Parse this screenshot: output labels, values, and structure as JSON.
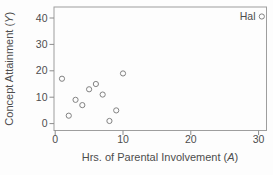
{
  "chart_data": {
    "type": "scatter",
    "title": "",
    "xlabel": "Hrs. of Parental Involvement (A)",
    "ylabel": "Concept Attainment (Y)",
    "xlim": [
      0,
      30
    ],
    "ylim": [
      0,
      40
    ],
    "x_ticks": [
      0,
      10,
      20,
      30
    ],
    "y_ticks": [
      0,
      10,
      20,
      30,
      40
    ],
    "grid": false,
    "legend": {
      "position": "top-right",
      "entries": [
        {
          "label": "Hal",
          "marker": "open-circle"
        }
      ]
    },
    "series": [
      {
        "name": "Hal",
        "marker": "open-circle",
        "points": [
          {
            "x": 1,
            "y": 17
          },
          {
            "x": 2,
            "y": 3
          },
          {
            "x": 3,
            "y": 9
          },
          {
            "x": 4,
            "y": 7
          },
          {
            "x": 5,
            "y": 13
          },
          {
            "x": 6,
            "y": 15
          },
          {
            "x": 7,
            "y": 11
          },
          {
            "x": 8,
            "y": 1
          },
          {
            "x": 9,
            "y": 5
          },
          {
            "x": 10,
            "y": 19
          }
        ]
      }
    ],
    "colors": {
      "background": "#fdfdfd",
      "frame": "#9e9e9e",
      "tick": "#8c8c8c",
      "text": "#4d4d4d",
      "marker_stroke": "#828282"
    }
  },
  "labels": {
    "xlabel_prefix": "Hrs. of Parental Involvement (",
    "xlabel_var": "A",
    "xlabel_suffix": ")",
    "ylabel_prefix": "Concept Attainment (",
    "ylabel_var": "Y",
    "ylabel_suffix": ")",
    "legend_label": "Hal"
  }
}
